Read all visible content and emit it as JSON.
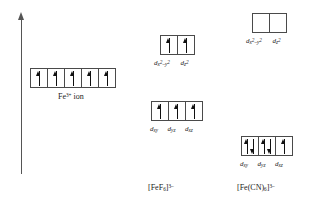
{
  "figure": {
    "title_present": false,
    "axis": {
      "name": "energy-axis",
      "direction": "up"
    },
    "groups": [
      {
        "id": "free-ion",
        "caption": "Fe3+ ion",
        "caption_html_parts": {
          "prefix": "Fe",
          "charge": "3+",
          "suffix": " ion"
        },
        "orbitals": [
          {
            "label_main": "d",
            "label_sub": "",
            "electrons": [
              "up"
            ]
          },
          {
            "label_main": "d",
            "label_sub": "",
            "electrons": [
              "up"
            ]
          },
          {
            "label_main": "d",
            "label_sub": "",
            "electrons": [
              "up"
            ]
          },
          {
            "label_main": "d",
            "label_sub": "",
            "electrons": [
              "up"
            ]
          },
          {
            "label_main": "d",
            "label_sub": "",
            "electrons": [
              "up"
            ]
          }
        ]
      },
      {
        "id": "fef6-eg",
        "set_name": "eg",
        "orbitals": [
          {
            "label_main": "d",
            "label_sub": "x2-y2",
            "electrons": [
              "up"
            ]
          },
          {
            "label_main": "d",
            "label_sub": "z2",
            "electrons": [
              "up"
            ]
          }
        ]
      },
      {
        "id": "fef6-t2g",
        "set_name": "t2g",
        "orbitals": [
          {
            "label_main": "d",
            "label_sub": "xy",
            "electrons": [
              "up"
            ]
          },
          {
            "label_main": "d",
            "label_sub": "yz",
            "electrons": [
              "up"
            ]
          },
          {
            "label_main": "d",
            "label_sub": "xz",
            "electrons": [
              "up"
            ]
          }
        ]
      },
      {
        "id": "fecn6-eg",
        "set_name": "eg",
        "orbitals": [
          {
            "label_main": "d",
            "label_sub": "x2-y2",
            "electrons": []
          },
          {
            "label_main": "d",
            "label_sub": "z2",
            "electrons": []
          }
        ]
      },
      {
        "id": "fecn6-t2g",
        "set_name": "t2g",
        "orbitals": [
          {
            "label_main": "d",
            "label_sub": "xy",
            "electrons": [
              "up",
              "down"
            ]
          },
          {
            "label_main": "d",
            "label_sub": "yz",
            "electrons": [
              "up",
              "down"
            ]
          },
          {
            "label_main": "d",
            "label_sub": "xz",
            "electrons": [
              "up"
            ]
          }
        ]
      }
    ],
    "captions": {
      "fef6": "[FeF6]3-",
      "fecn6": "[Fe(CN)6]3-"
    },
    "colors": {
      "box_stroke": "#4a4a4a",
      "arrow": "#101010",
      "axis": "#555555",
      "background": "#ffffff",
      "text": "#1a1a1a"
    }
  }
}
